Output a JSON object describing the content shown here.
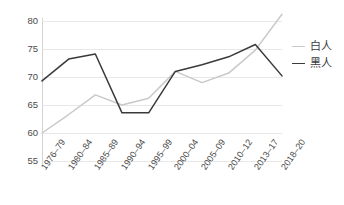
{
  "chart_data": {
    "type": "line",
    "title": "",
    "subtitle": "",
    "xlabel": "",
    "ylabel": "",
    "grid": true,
    "legend_position": "right",
    "ylim": [
      55,
      80
    ],
    "yticks": [
      55,
      60,
      65,
      70,
      75,
      80
    ],
    "categories": [
      "1976–79",
      "1980–84",
      "1985–89",
      "1990–94",
      "1995–99",
      "2000–04",
      "2005–09",
      "2010–12",
      "2013–17",
      "2018–20"
    ],
    "series": [
      {
        "name": "白人",
        "color": "#c9c9c9",
        "values": [
          60.0,
          63.3,
          66.8,
          65.0,
          66.2,
          71.0,
          69.0,
          70.7,
          74.8,
          81.2
        ]
      },
      {
        "name": "黑人",
        "color": "#3a3a3a",
        "values": [
          69.3,
          73.2,
          74.1,
          63.6,
          63.6,
          71.0,
          72.2,
          73.6,
          75.8,
          70.2
        ]
      }
    ]
  },
  "legend": {
    "items": [
      {
        "label": "白人",
        "color": "#c9c9c9"
      },
      {
        "label": "黑人",
        "color": "#3a3a3a"
      }
    ]
  },
  "colors": {
    "grid": "#e8e8e8",
    "axis": "#d2d2d2",
    "tick_text": "#4a4a4a",
    "background": "#ffffff"
  }
}
